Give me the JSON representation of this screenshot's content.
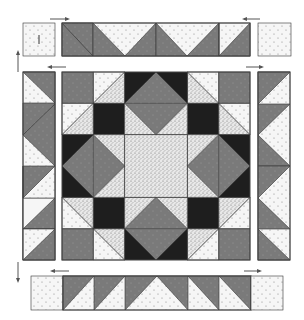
{
  "diagram": {
    "type": "quilt-block-assembly",
    "colors": {
      "background": "#ffffff",
      "light_dotted": "#f4f4f4",
      "speckled": "#e6e6e6",
      "medium_gray": "#7a7a7a",
      "dark": "#1e1e1e",
      "outline": "#333333"
    },
    "center_block": {
      "label": "center-block",
      "grid_units": 6,
      "description": "Star block with speckled center square, four gray on-point squares, black corner squares, and half-square triangle units"
    },
    "borders": {
      "top": {
        "label": "top-border-strip",
        "units": 6,
        "corner_squares": 2
      },
      "bottom": {
        "label": "bottom-border-strip",
        "units": 6,
        "corner_squares": 2
      },
      "left": {
        "label": "left-border-strip",
        "units": 6
      },
      "right": {
        "label": "right-border-strip",
        "units": 6
      }
    },
    "arrows": [
      {
        "position": "top-left",
        "direction": "right"
      },
      {
        "position": "top-right",
        "direction": "left"
      },
      {
        "position": "left-top",
        "direction": "left"
      },
      {
        "position": "right-top",
        "direction": "right"
      },
      {
        "position": "left-side",
        "direction": "up"
      },
      {
        "position": "left-bottom-side",
        "direction": "down"
      },
      {
        "position": "bottom-left",
        "direction": "left"
      },
      {
        "position": "bottom-right",
        "direction": "right"
      }
    ],
    "corner_mark": "|"
  }
}
